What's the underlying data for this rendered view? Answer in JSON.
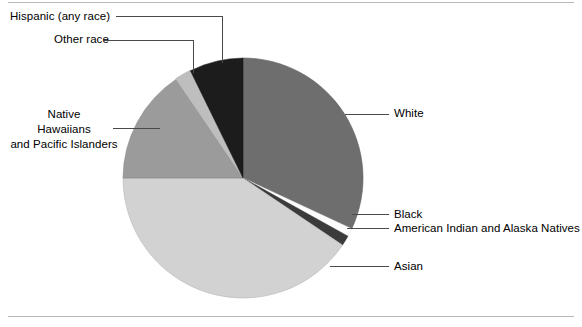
{
  "figure": {
    "name": "race-distribution-pie-chart",
    "top_rule": true,
    "bottom_rule": true
  },
  "chart_data": {
    "type": "pie",
    "title": "",
    "subtitle": "",
    "xlabel": "",
    "ylabel": "",
    "legend_position": "none",
    "labels_style": "leader-lines",
    "categories": [
      "White",
      "Black",
      "American Indian and Alaska Natives",
      "Asian",
      "Native Hawaiians and Pacific Islanders",
      "Other race",
      "Hispanic (any race)"
    ],
    "values": [
      32.0,
      1.1,
      1.4,
      40.6,
      15.6,
      2.2,
      7.1
    ],
    "start_angle_deg": 0,
    "direction": "clockwise",
    "slices": [
      {
        "label": "White",
        "start_deg": 0,
        "end_deg": 115,
        "color": "#6e6e6e"
      },
      {
        "label": "Black",
        "start_deg": 115,
        "end_deg": 119,
        "color": "#fdfdfd"
      },
      {
        "label": "American Indian and Alaska Natives",
        "start_deg": 119,
        "end_deg": 124,
        "color": "#3b3b3b"
      },
      {
        "label": "Asian",
        "start_deg": 124,
        "end_deg": 270,
        "color": "#d2d2d2"
      },
      {
        "label": "Native Hawaiians and Pacific Islanders",
        "start_deg": 270,
        "end_deg": 326,
        "color": "#9b9b9b"
      },
      {
        "label": "Other race",
        "start_deg": 326,
        "end_deg": 334,
        "color": "#bebebe"
      },
      {
        "label": "Hispanic (any race)",
        "start_deg": 334,
        "end_deg": 360,
        "color": "#1c1c1c"
      }
    ]
  },
  "labels": {
    "hispanic": "Hispanic (any race)",
    "other_race": "Other race",
    "native_hawaiians_line1": "Native",
    "native_hawaiians_line2": "Hawaiians",
    "native_hawaiians_line3": "and Pacific Islanders",
    "white": "White",
    "black": "Black",
    "american_indian": "American Indian and Alaska Natives",
    "asian": "Asian"
  },
  "colors": {
    "white_slice": "#6e6e6e",
    "black_slice": "#fdfdfd",
    "american_indian_slice": "#3b3b3b",
    "asian_slice": "#d2d2d2",
    "native_hawaiians_slice": "#9b9b9b",
    "other_race_slice": "#bebebe",
    "hispanic_slice": "#1c1c1c",
    "leader_line": "#4a4a4a",
    "rule": "#b9b9b9",
    "text": "#000000",
    "background": "#ffffff"
  }
}
